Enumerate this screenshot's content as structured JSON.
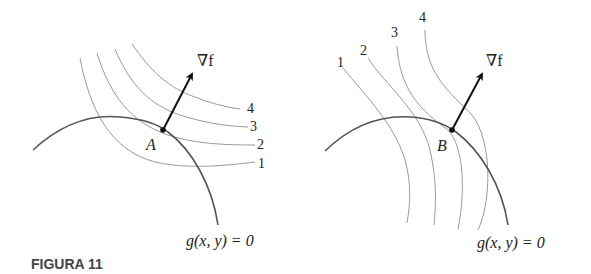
{
  "figure": {
    "caption": "FIGURA 11",
    "panels": [
      {
        "id": "left",
        "point_label": "A",
        "gradient_label": "∇f",
        "constraint_label": "g(x, y) = 0",
        "level_curve_labels": [
          "1",
          "2",
          "3",
          "4"
        ]
      },
      {
        "id": "right",
        "point_label": "B",
        "gradient_label": "∇f",
        "constraint_label": "g(x, y) = 0",
        "level_curve_labels": [
          "1",
          "2",
          "3",
          "4"
        ]
      }
    ]
  },
  "colors": {
    "constraint_curve": "#555555",
    "level_curves": "#9a9a9a",
    "arrow": "#111111",
    "caption": "#444444"
  }
}
